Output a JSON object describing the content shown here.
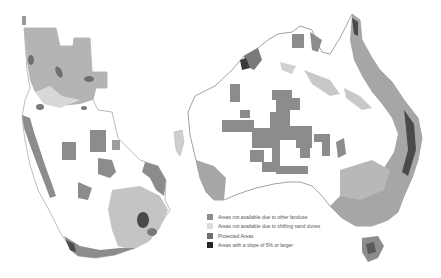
{
  "figure": {
    "maps": [
      {
        "region": "Southern Africa",
        "position": "left"
      },
      {
        "region": "Australia",
        "position": "right"
      }
    ],
    "legend": {
      "items": [
        {
          "label": "Areas not available due to other landuse",
          "color": "#8c8c8c"
        },
        {
          "label": "Areas not available due to shifting sand dunes",
          "color": "#dcdcdc"
        },
        {
          "label": "Protected Areas",
          "color": "#6e6e6e"
        },
        {
          "label": "Areas with a slope of 5% or larger",
          "color": "#262626"
        }
      ]
    },
    "colors": {
      "landuse": "#8c8c8c",
      "sand_dunes": "#c9c9c9",
      "protected": "#6e6e6e",
      "slope": "#2e2e2e",
      "available": "#ffffff",
      "outline": "#9a9a9a"
    }
  }
}
